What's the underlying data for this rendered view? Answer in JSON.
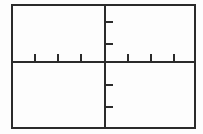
{
  "figure": {
    "title": "",
    "kind": "blank-cartesian-axes",
    "background_color": "#fdfdfd",
    "line_color": "#2b2b2b",
    "frame": {
      "x": 11.5,
      "y": 5.0,
      "width": 183.0,
      "height": 123.0,
      "stroke_width": 2.0
    },
    "origin": {
      "x": 105.0,
      "y": 62.0
    },
    "axes": {
      "x_axis": {
        "label": "",
        "y": 62.0,
        "x_start": 11.5,
        "x_end": 194.5,
        "stroke_width": 1.6
      },
      "y_axis": {
        "label": "",
        "x": 105.0,
        "y_start": 5.0,
        "y_end": 128.0,
        "stroke_width": 1.6
      }
    },
    "ticks": {
      "x_negative": [
        35.0,
        58.0,
        81.0
      ],
      "x_positive": [
        128.0,
        151.0,
        174.0
      ],
      "x_tick_length": 8.0,
      "x_tick_direction": "up",
      "y_positive": [
        22.0,
        44.0
      ],
      "y_negative": [
        85.0,
        107.0
      ],
      "y_tick_length": 8.0,
      "y_tick_direction": "right",
      "tick_stroke_width": 1.6,
      "tick_labels": []
    },
    "legend": {
      "visible": false,
      "entries": []
    },
    "annotations": []
  },
  "chart_data": {
    "type": "line",
    "title": "",
    "xlabel": "",
    "ylabel": "",
    "series": [],
    "x": [],
    "categories": [],
    "values": [],
    "xlim": [
      -4,
      4
    ],
    "ylim": [
      -3,
      3
    ],
    "grid": false,
    "legend_position": "none",
    "tick_labels_x": [],
    "tick_labels_y": [],
    "note": "Empty coordinate plane: no plotted data, no numeric tick labels rendered."
  }
}
